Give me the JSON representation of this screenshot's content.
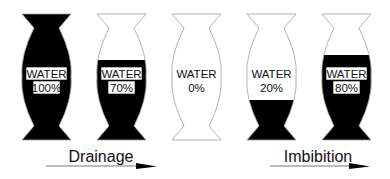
{
  "figure": {
    "background": "#ffffff",
    "fill_color": "#000000",
    "outline_color": "#a0a0a0",
    "vessels": [
      {
        "label": "WATER",
        "value": "100%",
        "fill_fraction": 1.0
      },
      {
        "label": "WATER",
        "value": "70%",
        "fill_fraction": 0.7
      },
      {
        "label": "WATER",
        "value": "0%",
        "fill_fraction": 0.0
      },
      {
        "label": "WATER",
        "value": "20%",
        "fill_fraction": 0.2
      },
      {
        "label": "WATER",
        "value": "80%",
        "fill_fraction": 0.8
      }
    ],
    "processes": [
      {
        "label": "Drainage",
        "direction": "right"
      },
      {
        "label": "Imbibition",
        "direction": "right"
      }
    ]
  }
}
